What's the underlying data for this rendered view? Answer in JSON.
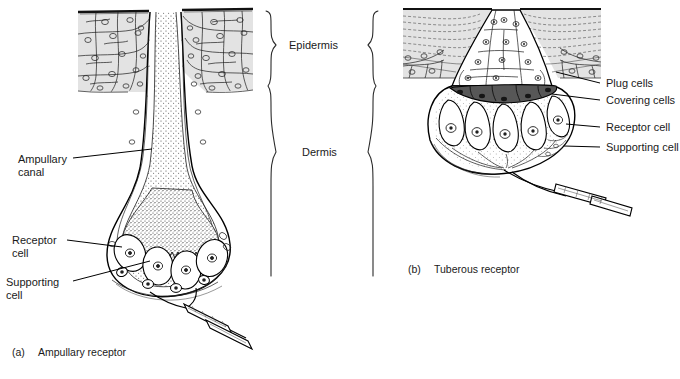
{
  "figure": {
    "background_color": "#ffffff",
    "ink_color": "#000000",
    "epidermis_fill": "#e3e3e3",
    "cell_fill": "#eeeeee",
    "covering_cell_fill": "#575757",
    "stipple_color": "#4a4a4a"
  },
  "brackets": {
    "epidermis_label": "Epidermis",
    "dermis_label": "Dermis"
  },
  "panel_a": {
    "caption_marker": "(a)",
    "caption_text": "Ampullary receptor",
    "labels": {
      "ampullary_canal_line1": "Ampullary",
      "ampullary_canal_line2": "canal",
      "receptor_cell_line1": "Receptor",
      "receptor_cell_line2": "cell",
      "supporting_cell_line1": "Supporting",
      "supporting_cell_line2": "cell"
    }
  },
  "panel_b": {
    "caption_marker": "(b)",
    "caption_text": "Tuberous receptor",
    "labels": {
      "plug_cells": "Plug cells",
      "covering_cells": "Covering cells",
      "receptor_cell": "Receptor cell",
      "supporting_cell": "Supporting cell"
    }
  }
}
